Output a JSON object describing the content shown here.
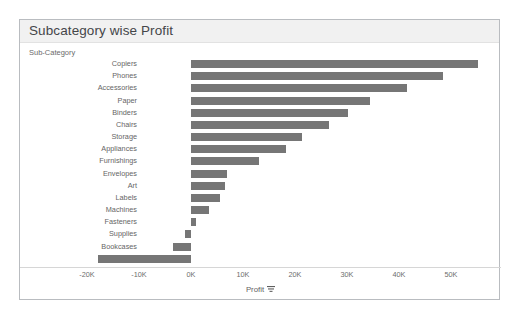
{
  "viz": {
    "title": "Subcategory wise Profit",
    "dimension_field_label": "Sub-Category"
  },
  "colors": {
    "bar": "#767676",
    "title_bar_background": "#f1f1f1",
    "frame_border": "#b9bcc0",
    "text": "#666666"
  },
  "axis": {
    "title": "Profit",
    "sort_icon": "sort-descending-icon",
    "tick_labels": [
      "-20K",
      "-10K",
      "0K",
      "10K",
      "20K",
      "30K",
      "40K",
      "50K"
    ]
  },
  "chart_data": {
    "type": "bar",
    "orientation": "horizontal",
    "title": "Subcategory wise Profit",
    "xlabel": "Profit",
    "ylabel": "Sub-Category",
    "xlim": [
      -20000,
      55000
    ],
    "xticks": [
      -20000,
      -10000,
      0,
      10000,
      20000,
      30000,
      40000,
      50000
    ],
    "xtick_labels": [
      "-20K",
      "-10K",
      "0K",
      "10K",
      "20K",
      "30K",
      "40K",
      "50K"
    ],
    "grid": false,
    "legend": "none",
    "sorted": "descending",
    "categories": [
      "Copiers",
      "Phones",
      "Accessories",
      "Paper",
      "Binders",
      "Chairs",
      "Storage",
      "Appliances",
      "Furnishings",
      "Envelopes",
      "Art",
      "Labels",
      "Machines",
      "Fasteners",
      "Supplies",
      "Bookcases",
      "Tables"
    ],
    "values": [
      55200,
      48400,
      41500,
      34500,
      30200,
      26600,
      21300,
      18200,
      13100,
      6900,
      6500,
      5500,
      3400,
      950,
      -1200,
      -3500,
      -17900
    ]
  }
}
